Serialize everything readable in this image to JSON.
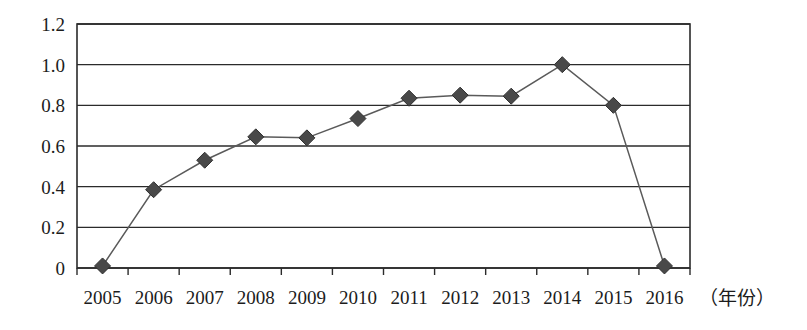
{
  "chart_data": {
    "type": "line",
    "title": "",
    "xlabel": "（年份）",
    "ylabel": "",
    "categories": [
      "2005",
      "2006",
      "2007",
      "2008",
      "2009",
      "2010",
      "2011",
      "2012",
      "2013",
      "2014",
      "2015",
      "2016"
    ],
    "values": [
      0.01,
      0.385,
      0.53,
      0.645,
      0.64,
      0.735,
      0.835,
      0.85,
      0.845,
      1.0,
      0.8,
      0.01
    ],
    "series": [
      {
        "name": "series-1",
        "values": [
          0.01,
          0.385,
          0.53,
          0.645,
          0.64,
          0.735,
          0.835,
          0.85,
          0.845,
          1.0,
          0.8,
          0.01
        ],
        "marker": "diamond",
        "line_color": "#5a5a5a",
        "marker_color": "#494949"
      }
    ],
    "ylim": [
      0,
      1.2
    ],
    "yticks": [
      0,
      0.2,
      0.4,
      0.6,
      0.8,
      1.0,
      1.2
    ],
    "ytick_labels": [
      "0",
      "0.2",
      "0.4",
      "0.6",
      "0.8",
      "1.0",
      "1.2"
    ],
    "xtick_labels": [
      "2005",
      "2006",
      "2007",
      "2008",
      "2009",
      "2010",
      "2011",
      "2012",
      "2013",
      "2014",
      "2015",
      "2016"
    ],
    "grid": "horizontal",
    "legend": "none",
    "plot_border": "box",
    "background_color": "#ffffff",
    "axis_color": "#2b2b2b"
  }
}
